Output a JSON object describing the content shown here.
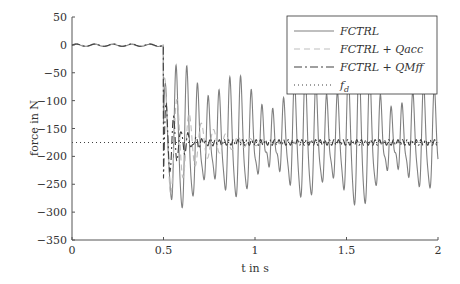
{
  "chart_data": {
    "type": "line",
    "title": "",
    "xlabel": "t in s",
    "ylabel": "force in N",
    "xlim": [
      0,
      2
    ],
    "ylim": [
      -350,
      50
    ],
    "xticks": [
      0,
      0.5,
      1,
      1.5,
      2
    ],
    "xtick_labels": [
      "0",
      "0.5",
      "1",
      "1.5",
      "2"
    ],
    "yticks": [
      50,
      0,
      -50,
      -100,
      -150,
      -200,
      -250,
      -300,
      -350
    ],
    "ytick_labels": [
      "50",
      "0",
      "−50",
      "−100",
      "−150",
      "−200",
      "−250",
      "−300",
      "−350"
    ],
    "grid": false,
    "legend_position": "upper right",
    "series": [
      {
        "name": "FCTRL",
        "style": "solid",
        "color": "#808080",
        "description": "Oscillates near 0 until t=0.5s, then steps to about -175 N with large sustained oscillations between roughly -310 and -55 N"
      },
      {
        "name": "FCTRL + Qacc",
        "style": "dashed",
        "color": "#bdbdbd",
        "description": "Near 0 until 0.5s, then oscillations between about -300 and -60 N decaying to about -175 N by ~0.9s"
      },
      {
        "name": "FCTRL + QMff",
        "style": "dashdot",
        "color": "#404040",
        "description": "Near 0 until 0.5s, then short transient down to about -270 N, settling near -175 N quickly"
      },
      {
        "name": "f_d",
        "style": "dotted",
        "color": "#404040",
        "description": "Desired force: constant at -175 N",
        "value": -175
      }
    ]
  },
  "legend": {
    "items": [
      {
        "label": "FCTRL"
      },
      {
        "label": "FCTRL + Qacc"
      },
      {
        "label": "FCTRL + QMff"
      },
      {
        "label": "f"
      }
    ],
    "fd_subscript": "d"
  },
  "axes": {
    "xlabel": "t in s",
    "ylabel": "force in N"
  }
}
